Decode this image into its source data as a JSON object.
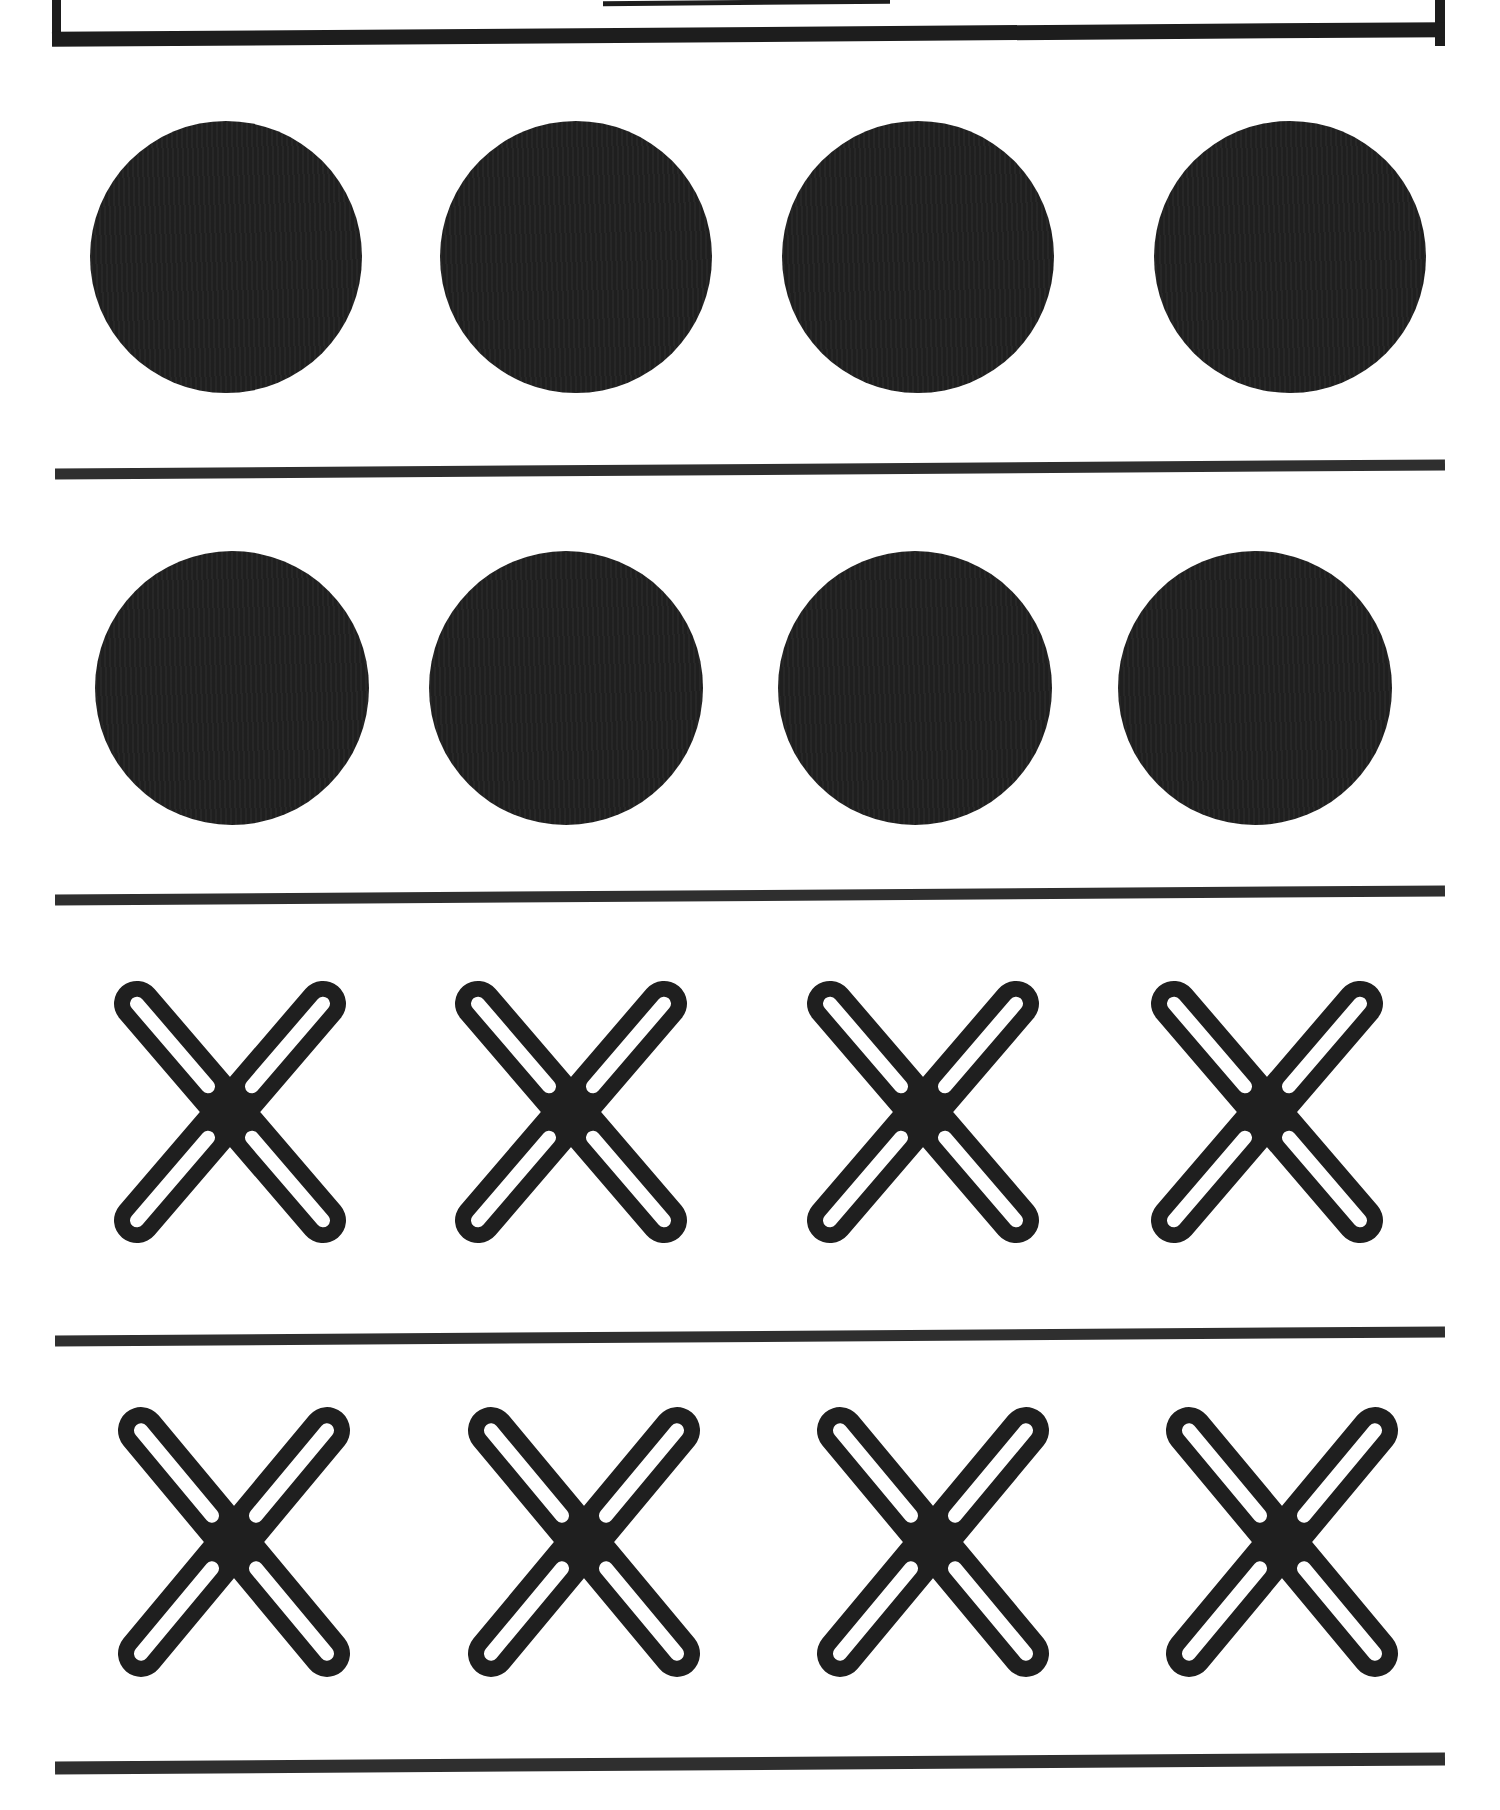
{
  "page": {
    "background": "#ffffff",
    "ink": "#1f1f1f",
    "divider_color": "#2f2f2f",
    "border_color": "#1d1d1d"
  },
  "header_box": {
    "underline_blank": true
  },
  "rows": [
    {
      "shape": "filled-circle",
      "count": 4
    },
    {
      "shape": "filled-circle",
      "count": 4
    },
    {
      "shape": "outline-x",
      "count": 4
    },
    {
      "shape": "outline-x",
      "count": 4
    }
  ],
  "divider_count": 4
}
